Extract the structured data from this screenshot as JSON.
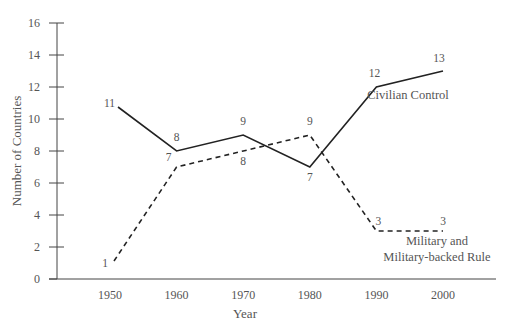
{
  "chart_data": {
    "type": "line",
    "title": "",
    "xlabel": "Year",
    "ylabel": "Number of Countries",
    "x": [
      1950,
      1960,
      1970,
      1980,
      1990,
      2000
    ],
    "xticks": [
      "1950",
      "1960",
      "1970",
      "1980",
      "1990",
      "2000"
    ],
    "yticks": [
      "0",
      "2",
      "4",
      "6",
      "8",
      "10",
      "12",
      "14",
      "16"
    ],
    "ylim": [
      0,
      16
    ],
    "grid": false,
    "series": [
      {
        "name": "Civilian Control",
        "style": "solid",
        "values": [
          11,
          8,
          9,
          7,
          12,
          13
        ]
      },
      {
        "name": "Military and Military-backed Rule",
        "style": "dashed",
        "values": [
          1,
          7,
          8,
          9,
          3,
          3
        ]
      }
    ],
    "legend": {
      "civilian": "Civilian Control",
      "military_line1": "Military and",
      "military_line2": "Military-backed Rule"
    },
    "colors": {
      "line": "#222222",
      "axis": "#444444",
      "text": "#555555"
    }
  }
}
